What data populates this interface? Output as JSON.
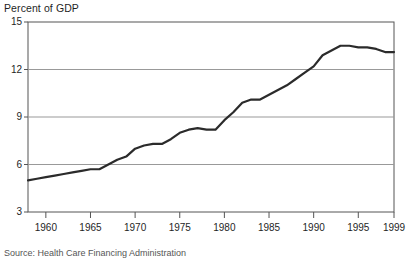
{
  "chart_data": {
    "type": "line",
    "title": "Percent of GDP",
    "xlabel": "",
    "ylabel": "Percent of GDP",
    "source": "Source: Health Care Financing Administration",
    "xlim": [
      1958,
      1999
    ],
    "ylim": [
      3,
      15
    ],
    "yticks": [
      3,
      6,
      9,
      12,
      15
    ],
    "xticks": [
      1960,
      1965,
      1970,
      1975,
      1980,
      1985,
      1990,
      1995,
      1999
    ],
    "xtick_labels": [
      "1960",
      "1965",
      "1970",
      "1975",
      "1980",
      "1985",
      "1990",
      "1995",
      "1999"
    ],
    "ytick_labels": [
      "3",
      "6",
      "9",
      "12",
      "15"
    ],
    "grid": "horizontal",
    "legend": "none",
    "line_color": "#2b2b2b",
    "axis_color": "#555555",
    "grid_color": "#999999",
    "background": "#ffffff",
    "series": [
      {
        "name": "National health expenditures",
        "x": [
          1958,
          1959,
          1960,
          1961,
          1962,
          1963,
          1964,
          1965,
          1966,
          1967,
          1968,
          1969,
          1970,
          1971,
          1972,
          1973,
          1974,
          1975,
          1976,
          1977,
          1978,
          1979,
          1980,
          1981,
          1982,
          1983,
          1984,
          1985,
          1986,
          1987,
          1988,
          1989,
          1990,
          1991,
          1992,
          1993,
          1994,
          1995,
          1996,
          1997,
          1998,
          1999
        ],
        "values": [
          5.0,
          5.1,
          5.2,
          5.3,
          5.4,
          5.5,
          5.6,
          5.7,
          5.7,
          6.0,
          6.3,
          6.5,
          7.0,
          7.2,
          7.3,
          7.3,
          7.6,
          8.0,
          8.2,
          8.3,
          8.2,
          8.2,
          8.8,
          9.3,
          9.9,
          10.1,
          10.1,
          10.4,
          10.7,
          11.0,
          11.4,
          11.8,
          12.2,
          12.9,
          13.2,
          13.5,
          13.5,
          13.4,
          13.4,
          13.3,
          13.1,
          13.1
        ]
      }
    ]
  }
}
